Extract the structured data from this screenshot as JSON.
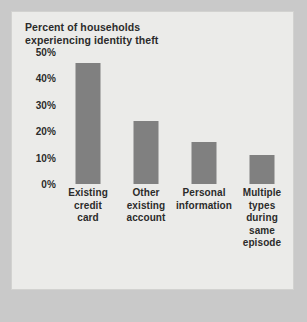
{
  "chart_data": {
    "type": "bar",
    "title": "Percent of households\nexperiencing identity theft",
    "xlabel": "",
    "ylabel": "",
    "categories": [
      "Existing\ncredit\ncard",
      "Other\nexisting\naccount",
      "Personal\ninformation",
      "Multiple\ntypes\nduring\nsame\nepisode"
    ],
    "values": [
      46,
      24,
      16,
      11
    ],
    "ylim": [
      0,
      50
    ],
    "ytick_labels": [
      "50%",
      "40%",
      "30%",
      "20%",
      "10%",
      "0%"
    ],
    "ytick_values": [
      50,
      40,
      30,
      20,
      10,
      0
    ],
    "grid": false,
    "legend": null,
    "bar_color": "#808080",
    "plot_background": "#ebebe9",
    "page_background": "#c9c9c9",
    "text_color": "#2b2b2b"
  }
}
